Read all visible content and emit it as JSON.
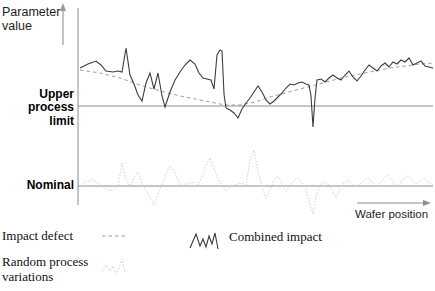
{
  "figure": {
    "y_axis_label": "Parameter\nvalue",
    "x_axis_label": "Wafer position",
    "upper_limit_label": "Upper\nprocess\nlimit",
    "nominal_label": "Nominal"
  },
  "legend": {
    "items": [
      {
        "label": "Impact defect",
        "style": "dashed",
        "color": "#9a9a9a"
      },
      {
        "label": "Random process\nvariations",
        "style": "dotted",
        "color": "#cfcfcf"
      },
      {
        "label": "Combined impact",
        "style": "solid",
        "color": "#3a3a3a"
      }
    ]
  },
  "colors": {
    "combined": "#3c3c3c",
    "defect": "#9d9d9d",
    "random": "#d2d2d2",
    "axis": "#8e8e8e",
    "text": "#1a1a1a"
  },
  "chart_data": {
    "type": "line",
    "title": "",
    "xlabel": "Wafer position",
    "ylabel": "Parameter value",
    "grid": false,
    "legend_position": "below-plot",
    "axis_lines": {
      "y_axis_x": 78,
      "upper_process_limit_y": 106,
      "nominal_y": 186
    },
    "reference_lines": [
      {
        "name": "Upper process limit",
        "y": 106
      },
      {
        "name": "Nominal",
        "y": 186
      }
    ],
    "series": [
      {
        "name": "Combined impact",
        "style": "solid",
        "points": [
          [
            80,
            68
          ],
          [
            88,
            64
          ],
          [
            96,
            61
          ],
          [
            101,
            65
          ],
          [
            106,
            71
          ],
          [
            113,
            72
          ],
          [
            118,
            71
          ],
          [
            122,
            72
          ],
          [
            126,
            48
          ],
          [
            130,
            75
          ],
          [
            134,
            84
          ],
          [
            138,
            95
          ],
          [
            142,
            101
          ],
          [
            146,
            83
          ],
          [
            150,
            73
          ],
          [
            154,
            89
          ],
          [
            158,
            73
          ],
          [
            162,
            96
          ],
          [
            165,
            107
          ],
          [
            170,
            92
          ],
          [
            175,
            80
          ],
          [
            180,
            72
          ],
          [
            185,
            65
          ],
          [
            190,
            60
          ],
          [
            195,
            64
          ],
          [
            199,
            73
          ],
          [
            203,
            78
          ],
          [
            207,
            79
          ],
          [
            211,
            80
          ],
          [
            214,
            89
          ],
          [
            217,
            55
          ],
          [
            220,
            50
          ],
          [
            222,
            51
          ],
          [
            224,
            94
          ],
          [
            226,
            108
          ],
          [
            230,
            110
          ],
          [
            234,
            113
          ],
          [
            238,
            118
          ],
          [
            242,
            109
          ],
          [
            246,
            103
          ],
          [
            250,
            98
          ],
          [
            254,
            92
          ],
          [
            258,
            86
          ],
          [
            262,
            92
          ],
          [
            266,
            100
          ],
          [
            270,
            104
          ],
          [
            274,
            101
          ],
          [
            278,
            97
          ],
          [
            282,
            93
          ],
          [
            286,
            88
          ],
          [
            290,
            84
          ],
          [
            294,
            85
          ],
          [
            298,
            83
          ],
          [
            302,
            82
          ],
          [
            306,
            84
          ],
          [
            309,
            85
          ],
          [
            311,
            96
          ],
          [
            313,
            127
          ],
          [
            315,
            98
          ],
          [
            317,
            80
          ],
          [
            321,
            79
          ],
          [
            325,
            82
          ],
          [
            329,
            78
          ],
          [
            333,
            75
          ],
          [
            337,
            78
          ],
          [
            341,
            80
          ],
          [
            345,
            75
          ],
          [
            349,
            71
          ],
          [
            353,
            77
          ],
          [
            357,
            81
          ],
          [
            361,
            76
          ],
          [
            365,
            70
          ],
          [
            369,
            65
          ],
          [
            373,
            68
          ],
          [
            377,
            71
          ],
          [
            381,
            66
          ],
          [
            385,
            63
          ],
          [
            389,
            67
          ],
          [
            393,
            62
          ],
          [
            397,
            64
          ],
          [
            401,
            60
          ],
          [
            405,
            62
          ],
          [
            409,
            58
          ],
          [
            413,
            65
          ],
          [
            417,
            63
          ],
          [
            421,
            61
          ],
          [
            425,
            66
          ],
          [
            429,
            67
          ],
          [
            433,
            68
          ]
        ]
      },
      {
        "name": "Impact defect",
        "style": "dashed",
        "points": [
          [
            80,
            70
          ],
          [
            100,
            73
          ],
          [
            120,
            78
          ],
          [
            140,
            85
          ],
          [
            160,
            91
          ],
          [
            180,
            96
          ],
          [
            200,
            100
          ],
          [
            215,
            103
          ],
          [
            225,
            105
          ],
          [
            240,
            105
          ],
          [
            255,
            102
          ],
          [
            270,
            97
          ],
          [
            285,
            93
          ],
          [
            300,
            89
          ],
          [
            315,
            85
          ],
          [
            330,
            81
          ],
          [
            345,
            77
          ],
          [
            360,
            74
          ],
          [
            375,
            71
          ],
          [
            390,
            68
          ],
          [
            405,
            66
          ],
          [
            420,
            64
          ],
          [
            433,
            63
          ]
        ]
      },
      {
        "name": "Random process variations",
        "style": "dotted",
        "points": [
          [
            80,
            186
          ],
          [
            86,
            182
          ],
          [
            92,
            180
          ],
          [
            98,
            183
          ],
          [
            104,
            188
          ],
          [
            110,
            191
          ],
          [
            114,
            189
          ],
          [
            118,
            186
          ],
          [
            122,
            163
          ],
          [
            126,
            180
          ],
          [
            130,
            186
          ],
          [
            134,
            178
          ],
          [
            138,
            172
          ],
          [
            142,
            183
          ],
          [
            146,
            190
          ],
          [
            150,
            198
          ],
          [
            154,
            205
          ],
          [
            158,
            195
          ],
          [
            162,
            184
          ],
          [
            166,
            174
          ],
          [
            170,
            166
          ],
          [
            174,
            171
          ],
          [
            178,
            180
          ],
          [
            182,
            186
          ],
          [
            186,
            184
          ],
          [
            190,
            183
          ],
          [
            194,
            182
          ],
          [
            198,
            185
          ],
          [
            202,
            176
          ],
          [
            206,
            165
          ],
          [
            210,
            158
          ],
          [
            214,
            168
          ],
          [
            218,
            180
          ],
          [
            222,
            186
          ],
          [
            226,
            191
          ],
          [
            230,
            188
          ],
          [
            234,
            185
          ],
          [
            238,
            184
          ],
          [
            242,
            183
          ],
          [
            246,
            185
          ],
          [
            250,
            160
          ],
          [
            254,
            150
          ],
          [
            258,
            172
          ],
          [
            262,
            186
          ],
          [
            266,
            199
          ],
          [
            270,
            190
          ],
          [
            274,
            180
          ],
          [
            278,
            176
          ],
          [
            282,
            184
          ],
          [
            286,
            192
          ],
          [
            290,
            186
          ],
          [
            294,
            180
          ],
          [
            298,
            178
          ],
          [
            302,
            183
          ],
          [
            306,
            190
          ],
          [
            310,
            205
          ],
          [
            313,
            214
          ],
          [
            316,
            196
          ],
          [
            320,
            186
          ],
          [
            324,
            181
          ],
          [
            328,
            184
          ],
          [
            332,
            190
          ],
          [
            336,
            198
          ],
          [
            340,
            189
          ],
          [
            344,
            183
          ],
          [
            348,
            180
          ],
          [
            352,
            184
          ],
          [
            356,
            187
          ],
          [
            360,
            184
          ],
          [
            364,
            180
          ],
          [
            368,
            178
          ],
          [
            372,
            182
          ],
          [
            376,
            187
          ],
          [
            380,
            183
          ],
          [
            384,
            178
          ],
          [
            388,
            175
          ],
          [
            392,
            180
          ],
          [
            396,
            186
          ],
          [
            400,
            183
          ],
          [
            404,
            178
          ],
          [
            408,
            176
          ],
          [
            412,
            180
          ],
          [
            416,
            184
          ],
          [
            420,
            181
          ],
          [
            424,
            178
          ],
          [
            428,
            182
          ],
          [
            433,
            185
          ]
        ]
      }
    ]
  }
}
